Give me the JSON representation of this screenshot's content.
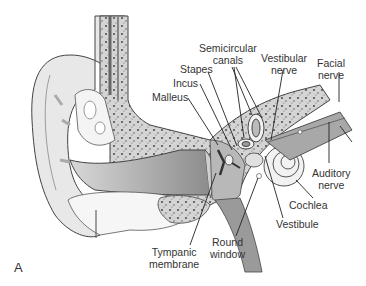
{
  "figure": {
    "panel_letter": "A",
    "colors": {
      "background": "#ffffff",
      "tissue_light": "#e6e6e6",
      "tissue_mid": "#bdbdbd",
      "tissue_dark": "#8f8f8f",
      "bone_fill": "#cfcfcf",
      "outline": "#444444",
      "label_text": "#333333"
    }
  },
  "labels": {
    "semicircular_canals_line1": "Semicircular",
    "semicircular_canals_line2": "canals",
    "vestibular_nerve_line1": "Vestibular",
    "vestibular_nerve_line2": "nerve",
    "facial_nerve_line1": "Facial",
    "facial_nerve_line2": "nerve",
    "stapes": "Stapes",
    "incus": "Incus",
    "malleus": "Malleus",
    "auditory_nerve_line1": "Auditory",
    "auditory_nerve_line2": "nerve",
    "cochlea": "Cochlea",
    "vestibule": "Vestibule",
    "round_window_line1": "Round",
    "round_window_line2": "window",
    "tympanic_membrane_line1": "Tympanic",
    "tympanic_membrane_line2": "membrane"
  }
}
